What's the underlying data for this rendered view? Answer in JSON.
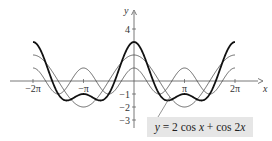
{
  "chart_data": {
    "type": "line",
    "title": "",
    "xlabel": "x",
    "ylabel": "y",
    "xlim": [
      -7.0,
      7.2
    ],
    "ylim": [
      -3.8,
      5.5
    ],
    "x_ticks": [
      {
        "value": -6.2832,
        "label": "−2π"
      },
      {
        "value": -3.1416,
        "label": "−π"
      },
      {
        "value": 3.1416,
        "label": "π"
      },
      {
        "value": 6.2832,
        "label": "2π"
      }
    ],
    "y_ticks": [
      {
        "value": 4,
        "label": "4"
      },
      {
        "value": -1,
        "label": "−1"
      },
      {
        "value": -2,
        "label": "−2"
      },
      {
        "value": -3,
        "label": "−3"
      }
    ],
    "series": [
      {
        "name": "y = 2 cos x + cos 2x",
        "expr": "2cos(x)+cos(2x)",
        "x_range": [
          -6.2832,
          6.2832
        ],
        "stroke_width": 1.8,
        "color": "#111111"
      },
      {
        "name": "y = 2 cos x",
        "expr": "2cos(x)",
        "x_range": [
          -6.2832,
          6.2832
        ],
        "stroke_width": 0.8,
        "color": "#444444"
      },
      {
        "name": "y = cos 2x",
        "expr": "cos(2x)",
        "x_range": [
          -6.2832,
          6.2832
        ],
        "stroke_width": 0.8,
        "color": "#444444"
      }
    ],
    "sample_points": {
      "x": [
        -6.2832,
        -4.7124,
        -3.1416,
        -1.5708,
        0,
        1.5708,
        3.1416,
        4.7124,
        6.2832
      ],
      "y_sum": [
        3,
        -1,
        -1,
        -1,
        3,
        -1,
        -1,
        -1,
        3
      ],
      "y_2cosx": [
        2,
        0,
        -2,
        0,
        2,
        0,
        -2,
        0,
        2
      ],
      "y_cos2x": [
        1,
        -1,
        1,
        -1,
        1,
        -1,
        1,
        -1,
        1
      ]
    },
    "annotation": "y = 2 cos x + cos 2x",
    "grid": false,
    "legend_position": "bottom-right label box with pointer"
  },
  "labels": {
    "annotation": "y = 2 cos x + cos 2x",
    "x_axis": "x",
    "y_axis": "y"
  }
}
